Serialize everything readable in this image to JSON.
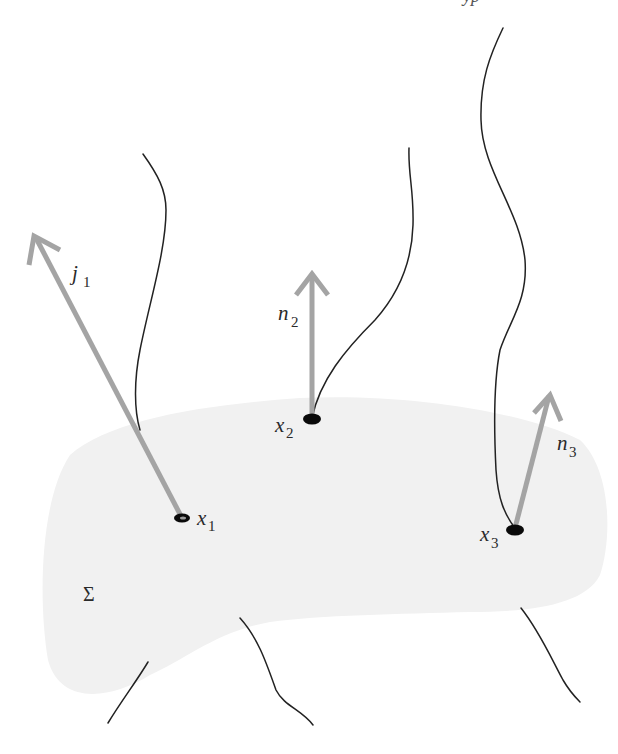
{
  "figure": {
    "header_fragment": "yp",
    "surface": {
      "label": "Σ",
      "fill_color": "#f1f1f1"
    },
    "points": [
      {
        "id": "x1",
        "label": "x",
        "subscript": "1"
      },
      {
        "id": "x2",
        "label": "x",
        "subscript": "2"
      },
      {
        "id": "x3",
        "label": "x",
        "subscript": "3"
      }
    ],
    "vectors": [
      {
        "id": "j1",
        "label": "j",
        "subscript": "1",
        "color": "#a4a4a4"
      },
      {
        "id": "n2",
        "label": "n",
        "subscript": "2",
        "color": "#a4a4a4"
      },
      {
        "id": "n3",
        "label": "n",
        "subscript": "3",
        "color": "#a4a4a4"
      }
    ],
    "curve_color": "#222222",
    "dot_color": "#0a0a0a"
  }
}
